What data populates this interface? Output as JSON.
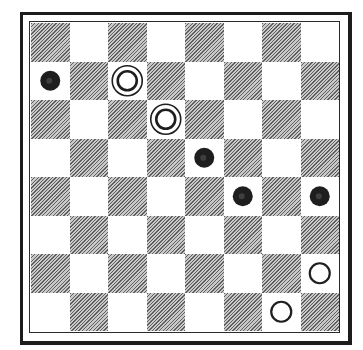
{
  "diagram": {
    "type": "checkers-position",
    "board_size": 8,
    "colors": {
      "dark_square": "#8c8c8c",
      "light_square": "#ffffff",
      "black_piece": "#1e1e1e",
      "white_piece_stroke": "#1e1e1e",
      "frame": "#1c1c1c"
    },
    "top_fragment": "·  · · ·  · · ·",
    "pieces": [
      {
        "color": "black",
        "kind": "man",
        "row": 1,
        "col": 0
      },
      {
        "color": "white",
        "kind": "king",
        "row": 1,
        "col": 2
      },
      {
        "color": "white",
        "kind": "king",
        "row": 2,
        "col": 3
      },
      {
        "color": "black",
        "kind": "man",
        "row": 3,
        "col": 4
      },
      {
        "color": "black",
        "kind": "man",
        "row": 4,
        "col": 5
      },
      {
        "color": "black",
        "kind": "man",
        "row": 4,
        "col": 7
      },
      {
        "color": "white",
        "kind": "man",
        "row": 6,
        "col": 7
      },
      {
        "color": "white",
        "kind": "man",
        "row": 7,
        "col": 6
      }
    ]
  }
}
